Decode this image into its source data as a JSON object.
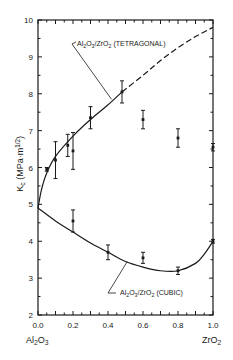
{
  "chart_data": {
    "type": "scatter",
    "title": "",
    "xlabel": "",
    "ylabel": "K_c (MPa·m^1/2)",
    "xlim": [
      0.0,
      1.0
    ],
    "ylim": [
      2,
      10
    ],
    "grid": false,
    "x_ticks": [
      "0.0",
      "0.2",
      "0.4",
      "0.6",
      "0.8",
      "1.0"
    ],
    "y_ticks": [
      "2",
      "3",
      "4",
      "5",
      "6",
      "7",
      "8",
      "9",
      "10"
    ],
    "x_end_labels": {
      "left": "Al2O3",
      "right": "ZrO2"
    },
    "series": [
      {
        "name": "Al2O3/ZrO2 (TETRAGONAL)",
        "style": "solid line, dashed for extrapolation above x≈0.48",
        "points": [
          {
            "x": 0.05,
            "y": 5.95,
            "err": 0.05
          },
          {
            "x": 0.1,
            "y": 6.2,
            "err": 0.5
          },
          {
            "x": 0.17,
            "y": 6.6,
            "err": 0.3
          },
          {
            "x": 0.2,
            "y": 6.45,
            "err": 0.5
          },
          {
            "x": 0.3,
            "y": 7.35,
            "err": 0.3
          },
          {
            "x": 0.48,
            "y": 8.05,
            "err": 0.3
          },
          {
            "x": 0.6,
            "y": 7.3,
            "err": 0.25
          },
          {
            "x": 0.8,
            "y": 6.8,
            "err": 0.25
          },
          {
            "x": 1.0,
            "y": 6.55,
            "err": 0.1
          }
        ],
        "curve": [
          [
            0.0,
            4.9
          ],
          [
            0.02,
            5.4
          ],
          [
            0.05,
            5.85
          ],
          [
            0.1,
            6.3
          ],
          [
            0.2,
            6.85
          ],
          [
            0.3,
            7.3
          ],
          [
            0.4,
            7.7
          ],
          [
            0.48,
            8.05
          ],
          [
            0.6,
            8.5
          ],
          [
            0.7,
            8.9
          ],
          [
            0.8,
            9.25
          ],
          [
            0.9,
            9.55
          ],
          [
            1.0,
            9.8
          ]
        ]
      },
      {
        "name": "Al2O3/ZrO2 (CUBIC)",
        "style": "solid line",
        "points": [
          {
            "x": 0.2,
            "y": 4.55,
            "err": 0.3
          },
          {
            "x": 0.4,
            "y": 3.7,
            "err": 0.2
          },
          {
            "x": 0.6,
            "y": 3.55,
            "err": 0.15
          },
          {
            "x": 0.8,
            "y": 3.2,
            "err": 0.1
          },
          {
            "x": 1.0,
            "y": 4.0,
            "err": 0.05
          }
        ],
        "curve": [
          [
            0.0,
            4.9
          ],
          [
            0.1,
            4.55
          ],
          [
            0.2,
            4.25
          ],
          [
            0.3,
            3.95
          ],
          [
            0.4,
            3.7
          ],
          [
            0.5,
            3.45
          ],
          [
            0.6,
            3.3
          ],
          [
            0.7,
            3.2
          ],
          [
            0.8,
            3.2
          ],
          [
            0.9,
            3.4
          ],
          [
            0.95,
            3.65
          ],
          [
            1.0,
            4.0
          ]
        ]
      }
    ],
    "annotations": [
      {
        "text_parts": [
          "Al",
          "2",
          "O",
          "3",
          "/ZrO",
          "2",
          " (TETRAGONAL)"
        ],
        "points_to": {
          "x": 0.42,
          "y": 7.85
        }
      },
      {
        "text_parts": [
          "Al",
          "2",
          "O",
          "3",
          "/ZrO",
          "2",
          " (CUBIC)"
        ],
        "points_to": {
          "x": 0.51,
          "y": 3.45
        }
      }
    ]
  }
}
